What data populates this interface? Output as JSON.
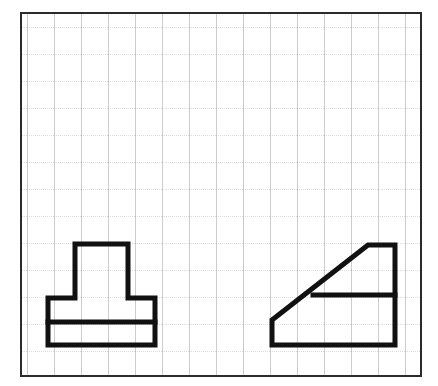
{
  "figure": {
    "background_color": "#ffffff",
    "width": 438,
    "height": 386
  },
  "grid": {
    "name": "square-grid",
    "border_color": "#2b2b2b",
    "border_width": 2,
    "x": 21,
    "y": 13,
    "width": 400,
    "height": 363,
    "cell_size": 27,
    "columns": 15,
    "rows": 13,
    "vertical_line_color": "#9a9a9a",
    "vertical_line_width": 1,
    "horizontal_line_color": "#b9b9b9",
    "horizontal_line_width": 1,
    "horizontal_line_style": "dotted",
    "vertical_line_style": "solid"
  },
  "shapes": {
    "stroke_color": "#111111",
    "stroke_width": 5,
    "fill": "none",
    "left": {
      "name": "tee-block-outline",
      "label": "Left view: stepped tee block",
      "outline_points": "75,244 128,244 128,298 155,298 155,345 48,345 48,298 75,298",
      "interior_lines": [
        {
          "name": "base-divider-line",
          "x1": 48,
          "y1": 322,
          "x2": 155,
          "y2": 322
        }
      ]
    },
    "right": {
      "name": "wedge-block-outline",
      "label": "Right view: wedge block with inclined face",
      "outline_points": "272,320 368,245 395,245 395,345 272,345",
      "interior_lines": [
        {
          "name": "step-divider-line",
          "x1": 313,
          "y1": 295,
          "x2": 395,
          "y2": 295
        }
      ]
    }
  }
}
